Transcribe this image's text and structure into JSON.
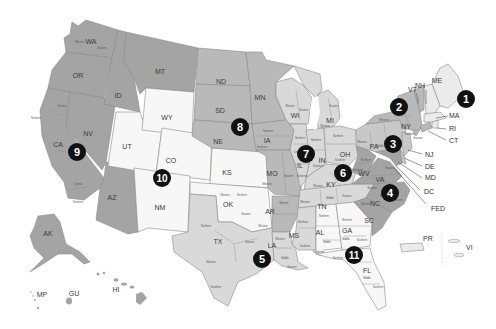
{
  "map": {
    "type": "US Federal Judicial Circuits",
    "colors": {
      "circuit_dark": "#a4a4a4",
      "circuit_mid": "#b9b9b9",
      "circuit_midlight": "#c8c8c8",
      "circuit_light": "#d9d9d9",
      "circuit_vlight": "#ebebeb",
      "circuit_white": "#f7f7f7",
      "badge": "#111111",
      "badge_text": "#ffffff"
    },
    "circuits": [
      {
        "number": "1",
        "x": 466,
        "y": 99
      },
      {
        "number": "2",
        "x": 399,
        "y": 107
      },
      {
        "number": "3",
        "x": 393,
        "y": 144
      },
      {
        "number": "4",
        "x": 390,
        "y": 193
      },
      {
        "number": "5",
        "x": 262,
        "y": 259
      },
      {
        "number": "6",
        "x": 343,
        "y": 173
      },
      {
        "number": "7",
        "x": 306,
        "y": 154
      },
      {
        "number": "8",
        "x": 240,
        "y": 127
      },
      {
        "number": "9",
        "x": 77,
        "y": 152
      },
      {
        "number": "10",
        "x": 162,
        "y": 178
      },
      {
        "number": "11",
        "x": 354,
        "y": 255
      }
    ],
    "states": {
      "WA": "WA",
      "OR": "OR",
      "CA": "CA",
      "NV": "NV",
      "ID": "ID",
      "MT": "MT",
      "AZ": "AZ",
      "AK": "AK",
      "HI": "HI",
      "GU": "GU",
      "MP": "MP",
      "UT": "UT",
      "WY": "WY",
      "CO": "CO",
      "NM": "NM",
      "KS": "KS",
      "OK": "OK",
      "ND": "ND",
      "SD": "SD",
      "NE": "NE",
      "MN": "MN",
      "IA": "IA",
      "MO": "MO",
      "AR": "AR",
      "WI": "WI",
      "IL": "IL",
      "IN": "IN",
      "MI": "MI",
      "OH": "OH",
      "KY": "KY",
      "TN": "TN",
      "TX": "TX",
      "LA": "LA",
      "MS": "MS",
      "AL": "AL",
      "GA": "GA",
      "FL": "FL",
      "WV": "WV",
      "VA": "VA",
      "NC": "NC",
      "SC": "SC",
      "PA": "PA",
      "NY": "NY",
      "VT": "VT",
      "NH": "NH",
      "ME": "ME",
      "MA": "MA",
      "RI": "RI",
      "CT": "CT",
      "NJ": "NJ",
      "DE": "DE",
      "MD": "MD",
      "DC": "DC",
      "FED": "FED",
      "PR": "PR",
      "VI": "VI"
    },
    "districts": {
      "wa_w": "Western",
      "wa_e": "Eastern",
      "ca_n": "Northern",
      "ca_e": "Eastern",
      "ca_c": "Central",
      "ca_s": "Southern",
      "ok_w": "Western",
      "ok_n": "Northern",
      "ok_e": "Eastern",
      "tx_n": "Northern",
      "tx_e": "Eastern",
      "tx_w": "Western",
      "tx_s": "Southern",
      "ia_n": "Northern",
      "ia_s": "Southern",
      "mo_w": "Western",
      "mo_e": "Eastern",
      "ar_w": "Western",
      "ar_e": "Eastern",
      "la_w": "Western",
      "la_m": "Middle",
      "la_e": "Eastern",
      "ms_n": "Northern",
      "ms_s": "Southern",
      "al_n": "Northern",
      "al_m": "Middle",
      "al_s": "Southern",
      "ga_n": "Northern",
      "ga_m": "Middle",
      "ga_s": "Southern",
      "fl_n": "Northern",
      "fl_m": "Middle",
      "fl_s": "Southern",
      "tn_w": "Western",
      "tn_m": "Middle",
      "tn_e": "Eastern",
      "ky_w": "Western",
      "ky_e": "Eastern",
      "oh_n": "Northern",
      "oh_s": "Southern",
      "mi_w": "Western",
      "mi_e": "Eastern",
      "wi_w": "Western",
      "wi_e": "Eastern",
      "il_n": "Northern",
      "il_c": "Central",
      "il_s": "Southern",
      "in_n": "Northern",
      "in_s": "Southern",
      "wv_n": "Northern",
      "wv_s": "Southern",
      "va_w": "Western",
      "va_e": "Eastern",
      "nc_w": "Western",
      "nc_m": "Middle",
      "nc_e": "Eastern",
      "pa_w": "Western",
      "pa_m": "Middle",
      "pa_e": "Eastern",
      "ny_n": "Northern",
      "ny_w": "Western",
      "ny_s": "Southern",
      "ny_e": "Eastern"
    }
  }
}
